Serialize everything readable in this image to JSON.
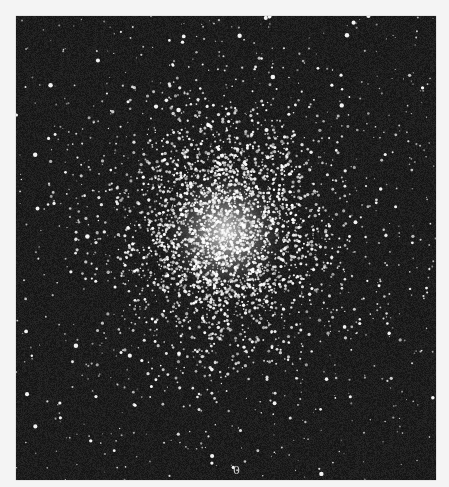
{
  "image": {
    "subject": "Globular star cluster photograph",
    "background_color": "#161616",
    "border_color": "#f4f4f4",
    "star_color": "#ffffff",
    "plate_label": "0",
    "cluster_center": {
      "x": 225,
      "y": 232
    }
  }
}
